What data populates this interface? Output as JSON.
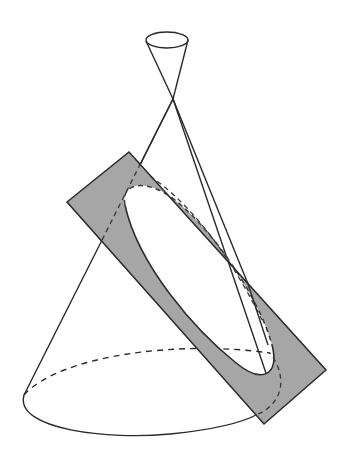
{
  "figure": {
    "colors": {
      "background": "#ffffff",
      "stroke": "#2a2a2a",
      "plane_fill": "#a6a6a6",
      "hidden_line": "#3a3a3a"
    },
    "elements": {
      "upper_nappe": "upper-cone",
      "lower_nappe": "lower-cone",
      "cutting_plane": "plane",
      "section_curve": "ellipse",
      "base_circle": "base-ellipse"
    }
  }
}
